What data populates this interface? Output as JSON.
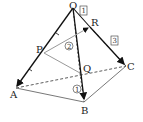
{
  "diagram": {
    "points": {
      "O": {
        "label": "O",
        "x": 73,
        "y": 8
      },
      "A": {
        "label": "A",
        "x": 16,
        "y": 88
      },
      "B": {
        "label": "B",
        "x": 84,
        "y": 102
      },
      "C": {
        "label": "C",
        "x": 126,
        "y": 66
      },
      "P": {
        "label": "P",
        "x": 44,
        "y": 53
      },
      "Q": {
        "label": "Q",
        "x": 80,
        "y": 73
      },
      "R": {
        "label": "R",
        "x": 90,
        "y": 27
      }
    },
    "annotations": {
      "one_boxed": "1",
      "three_boxed": "3",
      "one_circled": "1",
      "two_circled": "2"
    },
    "colors": {
      "solid_edge": "#111111",
      "dashed_edge": "#333333",
      "gray_segment": "#999999"
    }
  }
}
